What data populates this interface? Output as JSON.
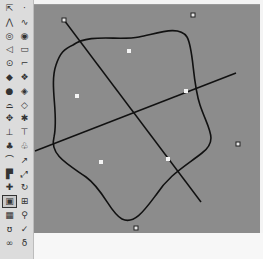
{
  "toolbar": {
    "selected_tool": "cage-edit",
    "tools": [
      {
        "name": "select-points",
        "glyph": "⇱",
        "col": 0,
        "row": 0
      },
      {
        "name": "point",
        "glyph": "·",
        "col": 1,
        "row": 0
      },
      {
        "name": "polyline",
        "glyph": "⋀",
        "col": 0,
        "row": 1
      },
      {
        "name": "curve",
        "glyph": "∿",
        "col": 1,
        "row": 1
      },
      {
        "name": "circle",
        "glyph": "◎",
        "col": 0,
        "row": 2
      },
      {
        "name": "ellipse",
        "glyph": "◉",
        "col": 1,
        "row": 2
      },
      {
        "name": "arc",
        "glyph": "◁",
        "col": 0,
        "row": 3
      },
      {
        "name": "rectangle",
        "glyph": "▭",
        "col": 1,
        "row": 3
      },
      {
        "name": "polygon",
        "glyph": "⊙",
        "col": 0,
        "row": 4
      },
      {
        "name": "fillet",
        "glyph": "⌐",
        "col": 1,
        "row": 4
      },
      {
        "name": "surface-from-points",
        "glyph": "◆",
        "col": 0,
        "row": 5
      },
      {
        "name": "network-surface",
        "glyph": "❖",
        "col": 1,
        "row": 5
      },
      {
        "name": "sphere",
        "glyph": "●",
        "col": 0,
        "row": 6
      },
      {
        "name": "box-solid",
        "glyph": "◈",
        "col": 1,
        "row": 6
      },
      {
        "name": "cylinder",
        "glyph": "⌓",
        "col": 0,
        "row": 7
      },
      {
        "name": "boolean-union",
        "glyph": "◇",
        "col": 1,
        "row": 7
      },
      {
        "name": "mesh",
        "glyph": "✥",
        "col": 0,
        "row": 8
      },
      {
        "name": "explode",
        "glyph": "✱",
        "col": 1,
        "row": 8
      },
      {
        "name": "trim",
        "glyph": "⊥",
        "col": 0,
        "row": 9
      },
      {
        "name": "split",
        "glyph": "⊤",
        "col": 1,
        "row": 9
      },
      {
        "name": "group",
        "glyph": "♣",
        "col": 0,
        "row": 10
      },
      {
        "name": "ungroup",
        "glyph": "♧",
        "col": 1,
        "row": 10
      },
      {
        "name": "blend",
        "glyph": "⌒",
        "col": 0,
        "row": 11
      },
      {
        "name": "sweep",
        "glyph": "↗",
        "col": 1,
        "row": 11
      },
      {
        "name": "extrude",
        "glyph": "▛",
        "col": 0,
        "row": 12
      },
      {
        "name": "loft",
        "glyph": "⤢",
        "col": 1,
        "row": 12
      },
      {
        "name": "move",
        "glyph": "✚",
        "col": 0,
        "row": 13
      },
      {
        "name": "rotate",
        "glyph": "↻",
        "col": 1,
        "row": 13
      },
      {
        "name": "cage-edit",
        "glyph": "▣",
        "col": 0,
        "row": 14
      },
      {
        "name": "dimension",
        "glyph": "⊞",
        "col": 1,
        "row": 14
      },
      {
        "name": "array",
        "glyph": "▦",
        "col": 0,
        "row": 15
      },
      {
        "name": "gumball",
        "glyph": "⚲",
        "col": 1,
        "row": 15
      },
      {
        "name": "bend",
        "glyph": "ʊ",
        "col": 0,
        "row": 16
      },
      {
        "name": "check",
        "glyph": "✓",
        "col": 1,
        "row": 16
      },
      {
        "name": "analyze",
        "glyph": "∞",
        "col": 0,
        "row": 17
      },
      {
        "name": "properties",
        "glyph": "δ",
        "col": 1,
        "row": 17
      }
    ]
  },
  "viewport": {
    "background": "#8c8c8c",
    "curve_color": "#111111",
    "control_points": [
      {
        "x": 30,
        "y": 15
      },
      {
        "x": 159,
        "y": 10
      },
      {
        "x": 204,
        "y": 139
      },
      {
        "x": 102,
        "y": 223
      }
    ],
    "highlight_points": [
      {
        "x": 95,
        "y": 46
      },
      {
        "x": 43,
        "y": 91
      },
      {
        "x": 152,
        "y": 86
      },
      {
        "x": 67,
        "y": 157
      },
      {
        "x": 134,
        "y": 154
      }
    ],
    "lines": [
      {
        "x1": 30,
        "y1": 15,
        "x2": 167,
        "y2": 197
      },
      {
        "x1": 1,
        "y1": 146,
        "x2": 202,
        "y2": 68
      }
    ]
  },
  "status": {
    "text": ""
  }
}
